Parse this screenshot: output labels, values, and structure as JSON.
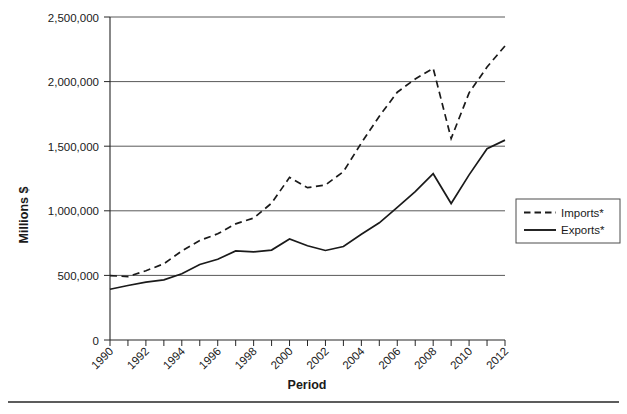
{
  "chart_data": {
    "type": "line",
    "title": "",
    "xlabel": "Period",
    "ylabel": "Millions $",
    "x": [
      1990,
      1991,
      1992,
      1993,
      1994,
      1995,
      1996,
      1997,
      1998,
      1999,
      2000,
      2001,
      2002,
      2003,
      2004,
      2005,
      2006,
      2007,
      2008,
      2009,
      2010,
      2011,
      2012
    ],
    "xlim": [
      1990,
      2012
    ],
    "ylim": [
      0,
      2500000
    ],
    "xtick_labels": [
      "1990",
      "1992",
      "1994",
      "1996",
      "1998",
      "2000",
      "2002",
      "2004",
      "2006",
      "2008",
      "2010",
      "2012"
    ],
    "xtick_values": [
      1990,
      1992,
      1994,
      1996,
      1998,
      2000,
      2002,
      2004,
      2006,
      2008,
      2010,
      2012
    ],
    "ytick_labels": [
      "0",
      "500,000",
      "1,000,000",
      "1,500,000",
      "2,000,000",
      "2,500,000"
    ],
    "ytick_values": [
      0,
      500000,
      1000000,
      1500000,
      2000000,
      2500000
    ],
    "grid": "horizontal",
    "legend_position": "right",
    "series": [
      {
        "name": "Imports*",
        "style": "dashed",
        "color": "#1a1a1a",
        "values": [
          498000,
          491000,
          536000,
          590000,
          689000,
          770000,
          822000,
          899000,
          944000,
          1059000,
          1259000,
          1179000,
          1200000,
          1303000,
          1525000,
          1732000,
          1918000,
          2020000,
          2103000,
          1559000,
          1913000,
          2113000,
          2276000
        ]
      },
      {
        "name": "Exports*",
        "style": "solid",
        "color": "#1a1a1a",
        "values": [
          393000,
          422000,
          448000,
          465000,
          513000,
          584000,
          625000,
          689000,
          682000,
          696000,
          782000,
          729000,
          693000,
          724000,
          818000,
          907000,
          1026000,
          1148000,
          1287000,
          1056000,
          1278000,
          1480000,
          1547000
        ]
      }
    ],
    "legend": [
      {
        "label": "Imports*",
        "style": "dashed"
      },
      {
        "label": "Exports*",
        "style": "solid"
      }
    ]
  }
}
